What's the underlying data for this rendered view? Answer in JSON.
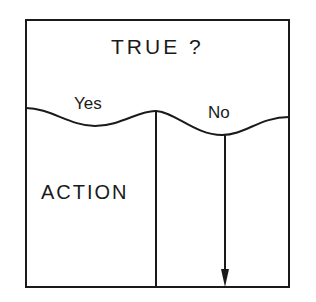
{
  "diagram": {
    "condition_label": "TRUE ?",
    "branches": [
      {
        "label": "Yes",
        "content": "ACTION"
      },
      {
        "label": "No",
        "content": ""
      }
    ],
    "no_branch_arrow": "down-arrow",
    "colors": {
      "line": "#1a1a1a",
      "background": "#ffffff"
    }
  }
}
